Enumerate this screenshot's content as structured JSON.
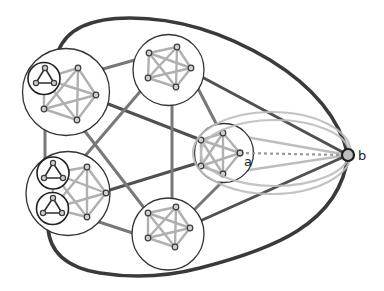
{
  "diagram": {
    "labels": {
      "a": "a",
      "b": "b"
    },
    "colors": {
      "background": "#ffffff",
      "outer_curve": "#3a3a3a",
      "edge_dark": "#505050",
      "edge_medium": "#787878",
      "cluster_edge": "#b0b0b0",
      "halo": "#bdbdbd",
      "circle_stroke": "#333333",
      "node_fill": "#cfcfcf",
      "node_stroke": "#3a3a3a",
      "triangle_edge": "#2e2e2e",
      "dotted": "#9a9a9a",
      "b_fill": "#bdbdbd"
    },
    "clusters": [
      {
        "id": "top-left",
        "cx": 66,
        "cy": 92,
        "r": 43.5,
        "nodes": [
          [
            78,
            68
          ],
          [
            96,
            95
          ],
          [
            77,
            120
          ],
          [
            44,
            109
          ]
        ],
        "subclusters": [
          {
            "cx": 44,
            "cy": 78.5,
            "r": 16,
            "nodes": [
              [
                45,
                68
              ],
              [
                36,
                83
              ],
              [
                54,
                83
              ]
            ]
          }
        ]
      },
      {
        "id": "top",
        "cx": 168.5,
        "cy": 70,
        "r": 35.5,
        "nodes": [
          [
            149,
            53
          ],
          [
            177,
            47
          ],
          [
            191,
            68
          ],
          [
            176,
            87
          ],
          [
            148,
            78
          ]
        ],
        "subclusters": []
      },
      {
        "id": "right",
        "cx": 224,
        "cy": 153,
        "r": 29.5,
        "nodes": [
          [
            201,
            140
          ],
          [
            223,
            133
          ],
          [
            240,
            153
          ],
          [
            223,
            174
          ],
          [
            201,
            166
          ]
        ],
        "subclusters": []
      },
      {
        "id": "bottom",
        "cx": 168,
        "cy": 234,
        "r": 36,
        "nodes": [
          [
            148,
            213
          ],
          [
            176,
            207
          ],
          [
            190,
            228
          ],
          [
            175,
            247
          ],
          [
            148,
            238
          ]
        ],
        "subclusters": []
      },
      {
        "id": "bottom-left",
        "cx": 68,
        "cy": 193.5,
        "r": 42,
        "nodes": [
          [
            87,
            167
          ],
          [
            106,
            193
          ],
          [
            87,
            217
          ]
        ],
        "subclusters": [
          {
            "cx": 53,
            "cy": 173,
            "r": 16,
            "nodes": [
              [
                53,
                163
              ],
              [
                44,
                178
              ],
              [
                63,
                178
              ]
            ]
          },
          {
            "cx": 52.5,
            "cy": 208.5,
            "r": 16,
            "nodes": [
              [
                53,
                198
              ],
              [
                43,
                213
              ],
              [
                62,
                213
              ]
            ]
          }
        ]
      }
    ],
    "inter_cluster_edges": [
      {
        "name": "edge-topleft-right",
        "tone": "dark",
        "pts": [
          80,
          93,
          201,
          140
        ]
      },
      {
        "name": "edge-bottomleft-right",
        "tone": "dark",
        "pts": [
          100,
          193,
          201,
          162
        ]
      },
      {
        "name": "edge-topleft-top",
        "tone": "medium",
        "pts": [
          78,
          76,
          149,
          56
        ]
      },
      {
        "name": "edge-topleft-bottom",
        "tone": "medium",
        "pts": [
          77,
          121,
          148,
          213
        ]
      },
      {
        "name": "edge-topleft-bottomleft",
        "tone": "medium",
        "pts": [
          45,
          120,
          45,
          165
        ]
      },
      {
        "name": "edge-top-right",
        "tone": "medium",
        "pts": [
          190,
          73,
          222,
          135
        ]
      },
      {
        "name": "edge-top-bottom",
        "tone": "medium",
        "pts": [
          172,
          90,
          172,
          210
        ]
      },
      {
        "name": "edge-top-bottomleft",
        "tone": "medium",
        "pts": [
          150,
          80,
          85,
          156
        ]
      },
      {
        "name": "edge-right-bottom",
        "tone": "medium",
        "pts": [
          224,
          180,
          190,
          214
        ]
      },
      {
        "name": "edge-bottom-bottomleft",
        "tone": "medium",
        "pts": [
          90,
          219,
          148,
          238
        ]
      },
      {
        "name": "edge-top-b",
        "tone": "dark",
        "pts": [
          200,
          76,
          348,
          155
        ]
      },
      {
        "name": "edge-bottom-b",
        "tone": "dark",
        "pts": [
          200,
          221,
          348,
          155
        ]
      }
    ],
    "outer_curves": [
      {
        "name": "outer-curve-top",
        "d": "M58,52 Q70,18 130,18 Q200,18 270,60 Q335,100 348,155"
      },
      {
        "name": "outer-curve-bottom",
        "d": "M48,227 Q50,265 100,273 Q150,281 200,268 C270,250 340,225 348,155"
      }
    ],
    "halo_ellipses": [
      {
        "cx": 272,
        "cy": 153,
        "rx": 79,
        "ry": 41
      },
      {
        "cx": 275,
        "cy": 153,
        "rx": 74,
        "ry": 33
      }
    ],
    "fan_edges": [
      [
        223,
        133,
        348,
        155
      ],
      [
        223,
        174,
        348,
        155
      ]
    ],
    "dotted_edge": [
      240,
      153,
      342,
      155
    ],
    "node_a": {
      "x": 240,
      "y": 153
    },
    "node_b": {
      "x": 348,
      "y": 155,
      "r": 6
    },
    "label_positions": {
      "a": [
        244,
        166
      ],
      "b": [
        358,
        160
      ]
    }
  }
}
